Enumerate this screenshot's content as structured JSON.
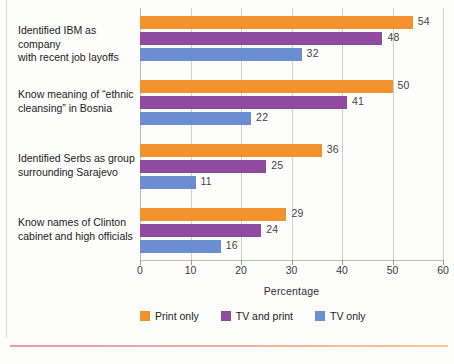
{
  "chart_data": {
    "type": "bar",
    "orientation": "horizontal",
    "title": "",
    "subtitle": "",
    "xlabel": "Percentage",
    "ylabel": "",
    "xlim": [
      0,
      60
    ],
    "xticks": [
      0,
      10,
      20,
      30,
      40,
      50,
      60
    ],
    "xtick_labels": [
      "0",
      "10",
      "20",
      "30",
      "40",
      "50",
      "60"
    ],
    "grid": true,
    "grid_axis": "x",
    "legend_position": "bottom",
    "categories": [
      "Identified IBM as company with recent job layoffs",
      "Know meaning of “ethnic cleansing” in Bosnia",
      "Identified Serbs as group surrounding Sarajevo",
      "Know names of Clinton cabinet and high officials"
    ],
    "category_lines": [
      [
        "Identified IBM as company",
        "with recent job layoffs"
      ],
      [
        "Know meaning of “ethnic",
        "cleansing” in Bosnia"
      ],
      [
        "Identified Serbs as group",
        "surrounding Sarajevo"
      ],
      [
        "Know names of Clinton",
        "cabinet and high officials"
      ]
    ],
    "series": [
      {
        "name": "Print only",
        "color": "#F2922E",
        "values": [
          54,
          50,
          36,
          29
        ]
      },
      {
        "name": "TV and print",
        "color": "#8E4BA0",
        "values": [
          48,
          41,
          25,
          24
        ]
      },
      {
        "name": "TV only",
        "color": "#6A8ECF",
        "values": [
          32,
          22,
          11,
          16
        ]
      }
    ]
  },
  "legend": {
    "items": [
      {
        "label": "Print only",
        "color": "#F2922E"
      },
      {
        "label": "TV and print",
        "color": "#8E4BA0"
      },
      {
        "label": "TV only",
        "color": "#6A8ECF"
      }
    ]
  },
  "axis": {
    "x_title": "Percentage",
    "ticks": [
      "0",
      "10",
      "20",
      "30",
      "40",
      "50",
      "60"
    ]
  }
}
